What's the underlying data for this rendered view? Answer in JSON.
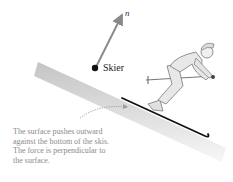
{
  "diagram": {
    "object_label": "Skier",
    "vector_label": "n⃗",
    "vector_name": "normal force",
    "caption_lines": [
      "The surface pushes outward",
      "against the bottom of the skis.",
      "The force is perpendicular to",
      "the surface."
    ],
    "colors": {
      "slope_gradient_start": "#c8c8c8",
      "slope_gradient_end": "#f2f2f2",
      "vector": "#8a8a8a",
      "ski": "#111111",
      "caption_text": "#8a8a8a",
      "dotted_arrow": "#9a9a9a"
    }
  }
}
